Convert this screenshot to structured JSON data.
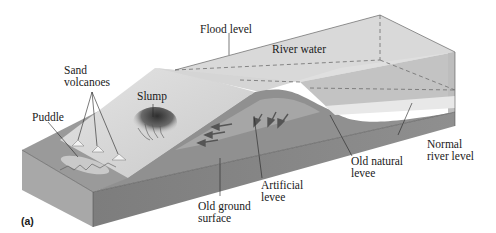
{
  "figure": {
    "panel_label": "(a)",
    "labels": {
      "flood_level": "Flood level",
      "river_water": "River water",
      "sand_volcanoes": "Sand\nvolcanoes",
      "slump": "Slump",
      "puddle": "Puddle",
      "normal_river_level": "Normal\nriver level",
      "old_natural_levee": "Old natural\nlevee",
      "artificial_levee": "Artificial\nlevee",
      "old_ground_surface": "Old ground\nsurface"
    },
    "colors": {
      "front_face": "#8a8a8a",
      "side_face": "#a3a3a3",
      "ground_top": "#9c9c9c",
      "levee_slope": "#d9d9d9",
      "water_volume": "#cfcfcf",
      "normal_water": "#b5b5b5",
      "leader_line": "#222222"
    }
  }
}
